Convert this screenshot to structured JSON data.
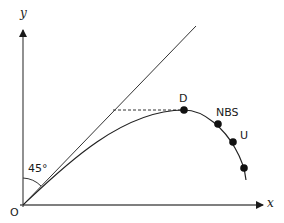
{
  "diagram": {
    "axes": {
      "x_label": "x",
      "y_label": "y",
      "origin_label": "O"
    },
    "angle_label": "45°",
    "reference_line": "45-degree line from origin",
    "points": [
      {
        "id": "D",
        "label": "D"
      },
      {
        "id": "NBS",
        "label": "NBS"
      },
      {
        "id": "U",
        "label": "U"
      },
      {
        "id": "P4",
        "label": ""
      }
    ],
    "dashed_line": "horizontal from 45-degree line to D"
  }
}
